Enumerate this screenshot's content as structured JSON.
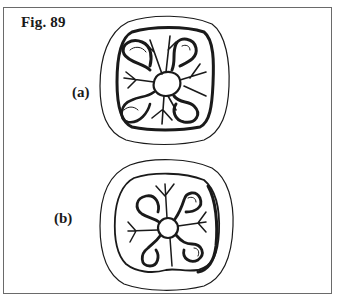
{
  "figure": {
    "title": "Fig. 89",
    "panels": [
      {
        "label": "(a)",
        "description": "seal impression line drawing with four loops around central boss and branching rays"
      },
      {
        "label": "(b)",
        "description": "seal impression line drawing with central circle, four looped arms and four branching stems"
      }
    ]
  },
  "colors": {
    "ink": "#1a1a1a",
    "frame": "#6a6a6a",
    "background": "#ffffff"
  }
}
